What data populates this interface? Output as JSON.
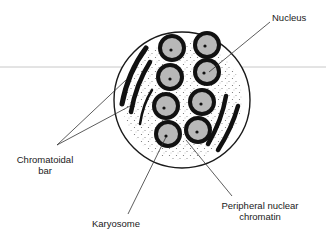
{
  "diagram": {
    "labels": {
      "nucleus": "Nucleus",
      "chromatoidal_bar_line1": "Chromatoidal",
      "chromatoidal_bar_line2": "bar",
      "karyosome": "Karyosome",
      "peripheral_line1": "Peripheral nuclear",
      "peripheral_line2": "chromatin"
    },
    "cyst": {
      "cx": 182,
      "cy": 100,
      "r": 68
    },
    "nuclei": [
      {
        "cx": 172,
        "cy": 48
      },
      {
        "cx": 207,
        "cy": 45
      },
      {
        "cx": 170,
        "cy": 77
      },
      {
        "cx": 207,
        "cy": 72
      },
      {
        "cx": 166,
        "cy": 106
      },
      {
        "cx": 202,
        "cy": 102
      },
      {
        "cx": 168,
        "cy": 134
      },
      {
        "cx": 198,
        "cy": 130
      }
    ],
    "colors": {
      "outline": "#1a1a1a",
      "nucleus_fill": "#b8b8b8",
      "guide_line": "#c8c8c8"
    }
  }
}
